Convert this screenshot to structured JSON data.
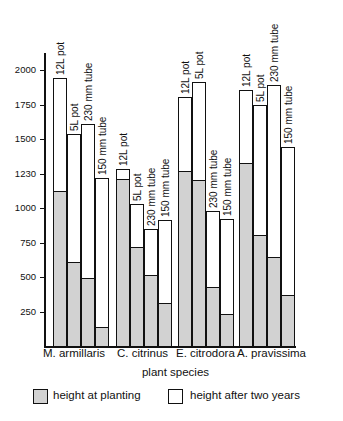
{
  "chart_data": {
    "type": "bar",
    "subtype": "stacked-overlay",
    "title": "",
    "xlabel": "plant species",
    "ylabel": "",
    "ylim": [
      0,
      2100
    ],
    "y_ticks": [
      {
        "value": 2000,
        "label": "2000"
      },
      {
        "value": 1750,
        "label": "1750"
      },
      {
        "value": 1500,
        "label": "1500"
      },
      {
        "value": 1250,
        "label": "1230"
      },
      {
        "value": 1000,
        "label": "1000"
      },
      {
        "value": 750,
        "label": "750"
      },
      {
        "value": 500,
        "label": "500"
      },
      {
        "value": 250,
        "label": "250"
      }
    ],
    "grid": false,
    "legend_position": "bottom",
    "categories": [
      "M. armillaris",
      "C. citrinus",
      "E. citrodora",
      "A. pravissima"
    ],
    "container_types": [
      "12L pot",
      "5L pot",
      "230 mm tube",
      "150 mm tube"
    ],
    "series": [
      {
        "name": "height at planting",
        "pattern": "stippled",
        "values": {
          "M. armillaris": [
            1125,
            610,
            490,
            140
          ],
          "C. citrinus": [
            1210,
            720,
            515,
            310
          ],
          "E. citrodora": [
            1270,
            1200,
            430,
            230
          ],
          "A. pravissima": [
            1325,
            805,
            645,
            370
          ]
        }
      },
      {
        "name": "height after two years",
        "pattern": "white",
        "values": {
          "M. armillaris": [
            1940,
            1535,
            1610,
            1215
          ],
          "C. citrinus": [
            1285,
            1030,
            850,
            910
          ],
          "E. citrodora": [
            1805,
            1910,
            980,
            920
          ],
          "A. pravissima": [
            1855,
            1745,
            1890,
            1440
          ]
        }
      }
    ],
    "groups": [
      {
        "label": "M. armillaris",
        "label_x": 43,
        "bars": [
          {
            "container": "12L pot",
            "x": 53,
            "planting": 1125,
            "after": 1940
          },
          {
            "container": "5L pot",
            "x": 67,
            "planting": 610,
            "after": 1535
          },
          {
            "container": "230 mm tube",
            "x": 81,
            "planting": 490,
            "after": 1610
          },
          {
            "container": "150 mm tube",
            "x": 95,
            "planting": 140,
            "after": 1215
          }
        ]
      },
      {
        "label": "C. citrinus",
        "label_x": 117,
        "bars": [
          {
            "container": "12L pot",
            "x": 116,
            "planting": 1210,
            "after": 1285
          },
          {
            "container": "5L pot",
            "x": 130,
            "planting": 720,
            "after": 1030
          },
          {
            "container": "230 mm tube",
            "x": 144,
            "planting": 515,
            "after": 850
          },
          {
            "container": "150 mm tube",
            "x": 158,
            "planting": 310,
            "after": 910
          }
        ]
      },
      {
        "label": "E. citrodora",
        "label_x": 176,
        "bars": [
          {
            "container": "12L pot",
            "x": 178,
            "planting": 1270,
            "after": 1805
          },
          {
            "container": "5L pot",
            "x": 192,
            "planting": 1200,
            "after": 1910
          },
          {
            "container": "230 mm tube",
            "x": 206,
            "planting": 430,
            "after": 980
          },
          {
            "container": "150 mm tube",
            "x": 220,
            "planting": 230,
            "after": 920
          }
        ]
      },
      {
        "label": "A. pravissima",
        "label_x": 237,
        "bars": [
          {
            "container": "12L pot",
            "x": 239,
            "planting": 1325,
            "after": 1855
          },
          {
            "container": "5L pot",
            "x": 253,
            "planting": 805,
            "after": 1745
          },
          {
            "container": "230 mm tube",
            "x": 267,
            "planting": 645,
            "after": 1890
          },
          {
            "container": "150 mm tube",
            "x": 281,
            "planting": 370,
            "after": 1440
          }
        ]
      }
    ]
  },
  "legend": {
    "planting_label": "height at planting",
    "after_label": "height after two years"
  },
  "axis": {
    "x_title": "plant species"
  },
  "colors": {
    "stipple_fill": "#d2d2d2",
    "line": "#111111",
    "background": "#ffffff"
  }
}
